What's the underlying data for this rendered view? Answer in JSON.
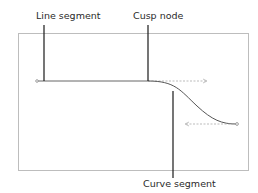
{
  "diagram": {
    "type": "path-anatomy",
    "labels": {
      "line_segment": "Line segment",
      "cusp_node": "Cusp node",
      "curve_segment": "Curve segment"
    },
    "colors": {
      "frame": "#bdbdbd",
      "path": "#555555",
      "handle": "#a8a8a8",
      "callout": "#1a1a1a",
      "text": "#2a2a2a"
    }
  }
}
